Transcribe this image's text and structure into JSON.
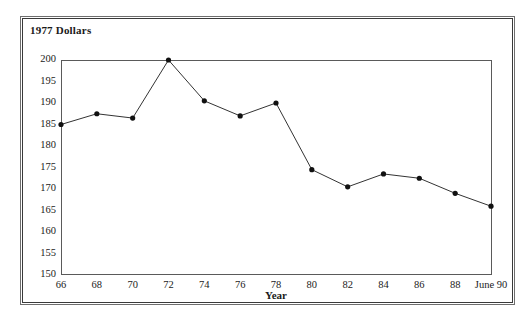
{
  "chart_data": {
    "type": "line",
    "title": "1977 Dollars",
    "xlabel": "Year",
    "ylabel": "",
    "categories": [
      "66",
      "68",
      "70",
      "72",
      "74",
      "76",
      "78",
      "80",
      "82",
      "84",
      "86",
      "88",
      "June 90"
    ],
    "values": [
      185,
      187.5,
      186.5,
      200,
      190.5,
      187,
      190,
      174.5,
      170.5,
      173.5,
      172.5,
      169,
      166
    ],
    "ylim": [
      150,
      200
    ],
    "ytick_labels": [
      "200",
      "195",
      "190",
      "185",
      "180",
      "175",
      "170",
      "165",
      "160",
      "155",
      "150"
    ],
    "ytick_values": [
      200,
      195,
      190,
      185,
      180,
      175,
      170,
      165,
      160,
      155,
      150
    ],
    "grid": false,
    "legend": "none",
    "marker": "filled-circle",
    "line_color": "#333333",
    "marker_color": "#111111",
    "axis_color": "#5a5a5a"
  },
  "frame": {
    "border_color": "#3a3a3a"
  }
}
